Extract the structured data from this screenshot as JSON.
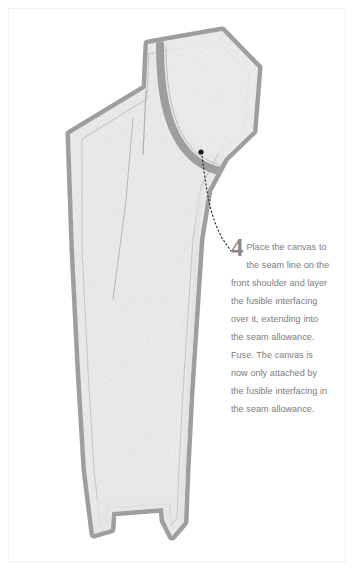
{
  "illustration": {
    "title": "Jacket front pattern piece with canvas and fusible interfacing",
    "subject": "tailoring-step-diagram",
    "colors": {
      "page_background": "#ffffff",
      "frame_line": "#f2f2f2",
      "seam_allowance_band": "#9a9a9a",
      "seam_allowance_band_dark": "#8c8c8c",
      "fabric_fill": "#eeeeee",
      "fabric_fill_light": "#f4f4f4",
      "inner_seam_line": "#b6b6b6",
      "marker_dot": "#1a1a1a",
      "leader_line": "#2b2b2b",
      "caption_text": "#7d7d7d",
      "caption_number": "#8a8a8a"
    },
    "marker": {
      "name": "callout-dot",
      "x": 201,
      "y": 152,
      "radius": 2.6
    },
    "leader": {
      "name": "dotted-leader-line",
      "style": "dotted",
      "from_x": 201,
      "from_y": 155,
      "to_x": 231,
      "to_y": 251
    }
  },
  "caption": {
    "number": "4",
    "text": "Place the canvas to the seam line on the front shoulder and layer the fusible interfacing over it, extending into the seam allowance. Fuse. The canvas is now only attached by the fusible interfacing in the seam allowance."
  }
}
